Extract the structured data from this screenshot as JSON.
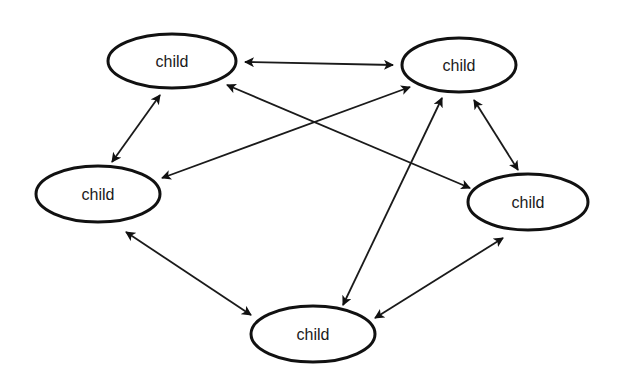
{
  "diagram": {
    "type": "network",
    "colors": {
      "stroke": "#111111",
      "background": "#ffffff",
      "text": "#1a1a1a"
    },
    "nodes": [
      {
        "id": "n1",
        "label": "child",
        "cx": 172,
        "cy": 61,
        "rx": 64,
        "ry": 27
      },
      {
        "id": "n2",
        "label": "child",
        "cx": 459,
        "cy": 65,
        "rx": 57,
        "ry": 27
      },
      {
        "id": "n3",
        "label": "child",
        "cx": 98,
        "cy": 194,
        "rx": 62,
        "ry": 28
      },
      {
        "id": "n4",
        "label": "child",
        "cx": 528,
        "cy": 202,
        "rx": 60,
        "ry": 28
      },
      {
        "id": "n5",
        "label": "child",
        "cx": 313,
        "cy": 334,
        "rx": 62,
        "ry": 28
      }
    ],
    "edges": [
      {
        "from": "n1",
        "to": "n2",
        "x1": 245,
        "y1": 62,
        "x2": 393,
        "y2": 65,
        "bidirectional": true
      },
      {
        "from": "n1",
        "to": "n3",
        "x1": 160,
        "y1": 95,
        "x2": 112,
        "y2": 162,
        "bidirectional": true
      },
      {
        "from": "n2",
        "to": "n4",
        "x1": 474,
        "y1": 100,
        "x2": 518,
        "y2": 170,
        "bidirectional": true
      },
      {
        "from": "n1",
        "to": "n4",
        "x1": 227,
        "y1": 85,
        "x2": 470,
        "y2": 188,
        "bidirectional": true
      },
      {
        "from": "n2",
        "to": "n3",
        "x1": 410,
        "y1": 87,
        "x2": 162,
        "y2": 178,
        "bidirectional": true
      },
      {
        "from": "n2",
        "to": "n5",
        "x1": 442,
        "y1": 98,
        "x2": 343,
        "y2": 305,
        "bidirectional": true
      },
      {
        "from": "n3",
        "to": "n5",
        "x1": 126,
        "y1": 232,
        "x2": 251,
        "y2": 315,
        "bidirectional": true
      },
      {
        "from": "n4",
        "to": "n5",
        "x1": 503,
        "y1": 238,
        "x2": 375,
        "y2": 318,
        "bidirectional": true
      }
    ]
  }
}
